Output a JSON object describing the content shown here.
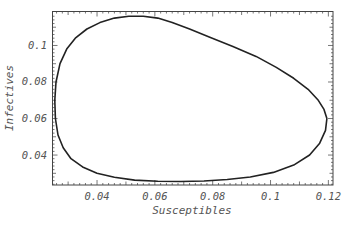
{
  "chart_data": {
    "type": "line",
    "title": "",
    "xlabel": "Susceptibles",
    "ylabel": "Infectives",
    "xlim": [
      0.0246,
      0.1216
    ],
    "ylim": [
      0.0236,
      0.1186
    ],
    "xticks": [
      0.04,
      0.06,
      0.08,
      0.1,
      0.12
    ],
    "xtick_labels": [
      "0.04",
      "0.06",
      "0.08",
      "0.1",
      "0.12"
    ],
    "yticks": [
      0.04,
      0.06,
      0.08,
      0.1
    ],
    "ytick_labels": [
      "0.04",
      "0.06",
      "0.08",
      "0.1"
    ],
    "grid": false,
    "legend": null,
    "series": [
      {
        "name": "Phase-plane orbit (closed cycle)",
        "x": [
          0.1195,
          0.1185,
          0.1165,
          0.113,
          0.108,
          0.102,
          0.095,
          0.087,
          0.079,
          0.072,
          0.066,
          0.061,
          0.056,
          0.051,
          0.046,
          0.041,
          0.0365,
          0.0325,
          0.0295,
          0.0272,
          0.0258,
          0.0254,
          0.0256,
          0.0265,
          0.0283,
          0.031,
          0.035,
          0.04,
          0.046,
          0.053,
          0.061,
          0.069,
          0.077,
          0.085,
          0.093,
          0.101,
          0.108,
          0.1135,
          0.117,
          0.119,
          0.1195
        ],
        "y": [
          0.06,
          0.065,
          0.07,
          0.076,
          0.082,
          0.088,
          0.094,
          0.0995,
          0.1045,
          0.109,
          0.1125,
          0.115,
          0.116,
          0.116,
          0.115,
          0.1125,
          0.109,
          0.104,
          0.098,
          0.09,
          0.08,
          0.07,
          0.06,
          0.051,
          0.044,
          0.038,
          0.0335,
          0.03,
          0.0278,
          0.0263,
          0.0256,
          0.0255,
          0.0258,
          0.0266,
          0.028,
          0.0305,
          0.0345,
          0.04,
          0.0465,
          0.0535,
          0.06
        ]
      }
    ]
  },
  "colors": {
    "background": "#ffffff",
    "curve": "#222222",
    "frame": "#444444",
    "text": "#555555"
  }
}
